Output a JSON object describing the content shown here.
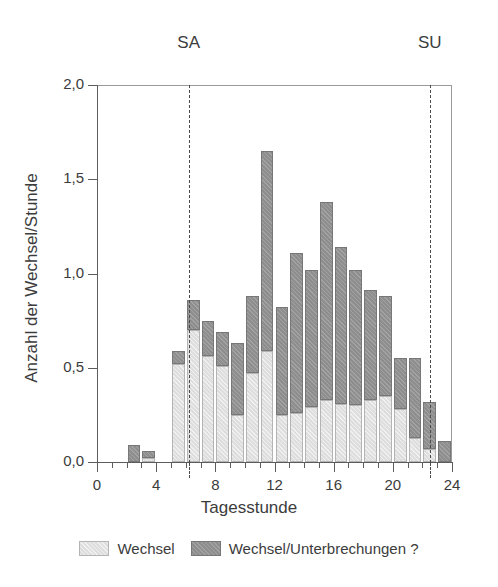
{
  "chart_data": {
    "type": "bar",
    "title": "",
    "subtitle": "",
    "xlabel": "Tagesstunde",
    "ylabel": "Anzahl der Wechsel/Stunde",
    "stacked": true,
    "grid": false,
    "legend_position": "bottom",
    "xlim": [
      0,
      24
    ],
    "ylim": [
      0.0,
      2.0
    ],
    "xticks_major": [
      0,
      4,
      8,
      12,
      16,
      20,
      24
    ],
    "xtick_labels": [
      "0",
      "4",
      "8",
      "12",
      "16",
      "20",
      "24"
    ],
    "xticks_minor": [
      1,
      2,
      3,
      5,
      6,
      7,
      9,
      10,
      11,
      13,
      14,
      15,
      17,
      18,
      19,
      21,
      22,
      23
    ],
    "yticks": [
      0.0,
      0.5,
      1.0,
      1.5,
      2.0
    ],
    "ytick_labels": [
      "0,0",
      "0,5",
      "1,0",
      "1,5",
      "2,0"
    ],
    "categories": [
      "0",
      "1",
      "2",
      "3",
      "4",
      "5",
      "6",
      "7",
      "8",
      "9",
      "10",
      "11",
      "12",
      "13",
      "14",
      "15",
      "16",
      "17",
      "18",
      "19",
      "20",
      "21",
      "22",
      "23"
    ],
    "series": [
      {
        "name": "Wechsel",
        "color": "#dedede",
        "values": [
          0.0,
          0.0,
          0.0,
          0.02,
          0.0,
          0.52,
          0.7,
          0.56,
          0.51,
          0.25,
          0.47,
          0.59,
          0.25,
          0.26,
          0.29,
          0.33,
          0.31,
          0.3,
          0.33,
          0.35,
          0.28,
          0.13,
          0.07,
          0.0
        ]
      },
      {
        "name": "Wechsel/Unterbrechungen ?",
        "color": "#8e8e8e",
        "values": [
          0.0,
          0.0,
          0.09,
          0.04,
          0.0,
          0.07,
          0.16,
          0.19,
          0.18,
          0.38,
          0.41,
          1.06,
          0.57,
          0.85,
          0.73,
          1.05,
          0.83,
          0.72,
          0.58,
          0.53,
          0.27,
          0.42,
          0.25,
          0.11
        ]
      }
    ],
    "totals": [
      0.0,
      0.0,
      0.09,
      0.06,
      0.0,
      0.59,
      0.86,
      0.75,
      0.69,
      0.63,
      0.88,
      1.65,
      0.82,
      1.11,
      1.02,
      1.38,
      1.14,
      1.02,
      0.91,
      0.88,
      0.55,
      0.55,
      0.32,
      0.11
    ],
    "annotations": [
      {
        "label": "SA",
        "x": 6.2,
        "style": "dashed-vline"
      },
      {
        "label": "SU",
        "x": 22.5,
        "style": "dashed-vline"
      }
    ]
  }
}
